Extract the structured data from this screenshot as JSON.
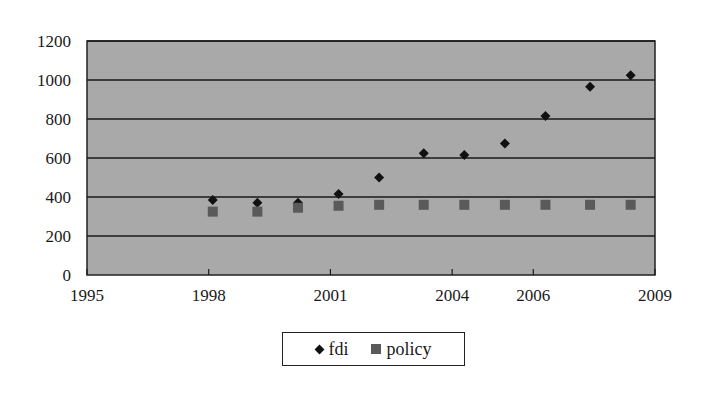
{
  "chart_data": {
    "type": "scatter",
    "title": "",
    "xlabel": "",
    "ylabel": "",
    "xlim": [
      1995,
      2009
    ],
    "ylim": [
      0,
      1200
    ],
    "x_ticks": [
      "1995",
      "1998",
      "2001",
      "2004",
      "2006",
      "2009"
    ],
    "y_ticks": [
      "0",
      "200",
      "400",
      "600",
      "800",
      "1000",
      "1200"
    ],
    "grid": "horizontal",
    "legend_position": "bottom",
    "plot_background": "#a9a9a9",
    "x": [
      1998.1,
      1999.2,
      2000.2,
      2001.2,
      2002.2,
      2003.3,
      2004.3,
      2005.3,
      2006.3,
      2007.4,
      2008.4
    ],
    "series": [
      {
        "name": "fdi",
        "marker": "diamond",
        "color": "#111111",
        "values": [
          385,
          370,
          370,
          415,
          500,
          625,
          615,
          675,
          815,
          965,
          1025
        ]
      },
      {
        "name": "policy",
        "marker": "square",
        "color": "#5a5a5a",
        "values": [
          325,
          325,
          345,
          355,
          360,
          360,
          360,
          360,
          360,
          360,
          360
        ]
      }
    ]
  },
  "legend": {
    "items": [
      {
        "label": "fdi"
      },
      {
        "label": "policy"
      }
    ]
  }
}
